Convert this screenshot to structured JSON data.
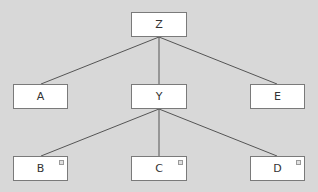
{
  "diagram": {
    "type": "tree",
    "background": "#d8d8d8",
    "edge_color": "#555555",
    "nodes": [
      {
        "id": "Z",
        "label": "Z",
        "x": 131,
        "y": 12,
        "w": 56,
        "h": 25,
        "marker": false
      },
      {
        "id": "A",
        "label": "A",
        "x": 13,
        "y": 84,
        "w": 55,
        "h": 25,
        "marker": false
      },
      {
        "id": "Y",
        "label": "Y",
        "x": 131,
        "y": 84,
        "w": 56,
        "h": 25,
        "marker": false
      },
      {
        "id": "E",
        "label": "E",
        "x": 250,
        "y": 84,
        "w": 55,
        "h": 25,
        "marker": false
      },
      {
        "id": "B",
        "label": "B",
        "x": 13,
        "y": 156,
        "w": 55,
        "h": 25,
        "marker": true
      },
      {
        "id": "C",
        "label": "C",
        "x": 131,
        "y": 156,
        "w": 56,
        "h": 25,
        "marker": true
      },
      {
        "id": "D",
        "label": "D",
        "x": 250,
        "y": 156,
        "w": 55,
        "h": 25,
        "marker": true
      }
    ],
    "edges": [
      {
        "from": "Z",
        "to": "A"
      },
      {
        "from": "Z",
        "to": "Y"
      },
      {
        "from": "Z",
        "to": "E"
      },
      {
        "from": "Y",
        "to": "B"
      },
      {
        "from": "Y",
        "to": "C"
      },
      {
        "from": "Y",
        "to": "D"
      }
    ]
  }
}
